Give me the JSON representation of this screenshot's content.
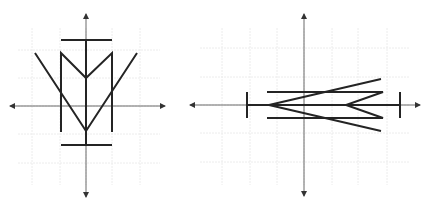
{
  "figures": [
    {
      "id": "figure-left",
      "description": "Symmetric figure about the vertical axis (vertical orientation)",
      "origin": [
        86,
        106
      ],
      "grid": {
        "vertical_x": [
          32,
          60,
          86,
          112,
          140
        ],
        "horizontal_y": [
          50,
          78,
          106,
          134,
          163
        ],
        "x_range": [
          18,
          160
        ],
        "y_range": [
          28,
          185
        ]
      },
      "axes": {
        "x": {
          "from": [
            10,
            106
          ],
          "to": [
            165,
            106
          ]
        },
        "y": {
          "from": [
            86,
            14
          ],
          "to": [
            86,
            197
          ]
        }
      },
      "segments": [
        {
          "name": "top-bar",
          "points": [
            [
              61,
              40
            ],
            [
              112,
              40
            ]
          ]
        },
        {
          "name": "bottom-bar",
          "points": [
            [
              61,
              145
            ],
            [
              112,
              145
            ]
          ]
        },
        {
          "name": "center-stem",
          "points": [
            [
              86,
              40
            ],
            [
              86,
              145
            ]
          ]
        },
        {
          "name": "m-shape",
          "points": [
            [
              61,
              132
            ],
            [
              61,
              53
            ],
            [
              86,
              78
            ],
            [
              112,
              53
            ],
            [
              112,
              132
            ]
          ]
        },
        {
          "name": "big-v",
          "points": [
            [
              35,
              53
            ],
            [
              86,
              131
            ],
            [
              137,
              53
            ]
          ]
        }
      ]
    },
    {
      "id": "figure-right",
      "description": "Same figure rotated to horizontal orientation",
      "origin": [
        304,
        105
      ],
      "grid": {
        "vertical_x": [
          222,
          250,
          277,
          304,
          332,
          358,
          387
        ],
        "horizontal_y": [
          48,
          77,
          105,
          133,
          162
        ],
        "x_range": [
          200,
          410
        ],
        "y_range": [
          28,
          185
        ]
      },
      "axes": {
        "x": {
          "from": [
            190,
            105
          ],
          "to": [
            420,
            105
          ]
        },
        "y": {
          "from": [
            304,
            14
          ],
          "to": [
            304,
            196
          ]
        }
      },
      "segments": [
        {
          "name": "left-bar",
          "points": [
            [
              247,
              92
            ],
            [
              247,
              118
            ]
          ]
        },
        {
          "name": "right-bar",
          "points": [
            [
              400,
              92
            ],
            [
              400,
              118
            ]
          ]
        },
        {
          "name": "center-stem",
          "points": [
            [
              247,
              105
            ],
            [
              400,
              105
            ]
          ]
        },
        {
          "name": "m-shape-rotated",
          "points": [
            [
              267,
              92
            ],
            [
              383,
              92
            ],
            [
              346,
              105
            ],
            [
              383,
              118
            ],
            [
              267,
              118
            ]
          ]
        },
        {
          "name": "big-v-rotated",
          "points": [
            [
              381,
              79
            ],
            [
              269,
              105
            ],
            [
              381,
              131
            ]
          ]
        }
      ]
    }
  ],
  "colors": {
    "shape": "#242424",
    "axis": "#6b6b6b",
    "grid": "#ececec",
    "background": "#ffffff"
  }
}
